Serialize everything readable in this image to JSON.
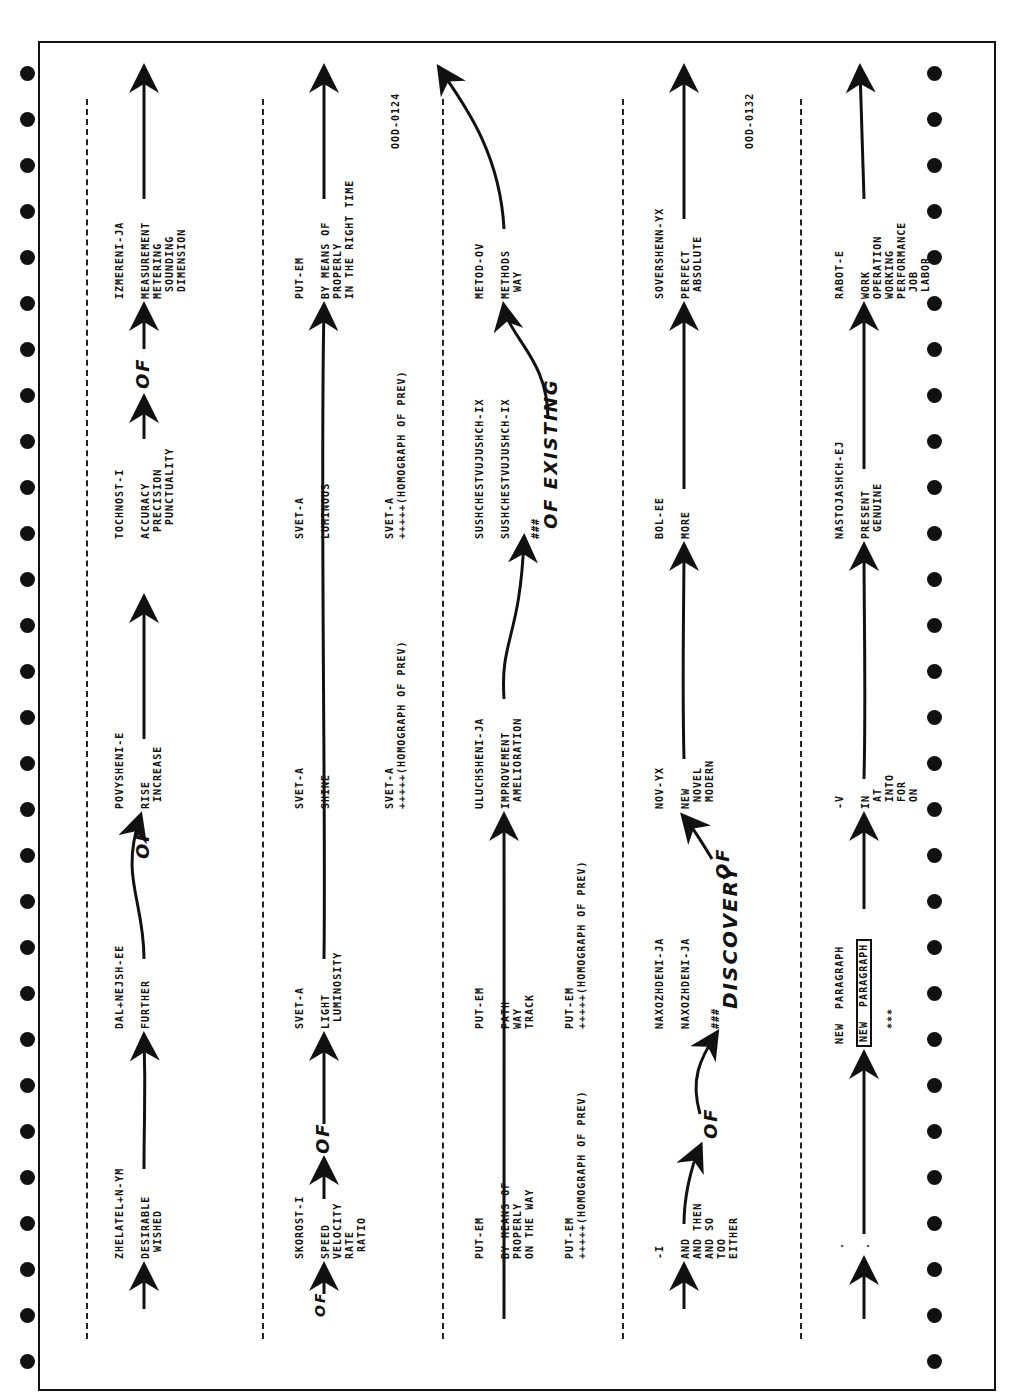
{
  "document": {
    "orientation": "rotated-90-ccw",
    "kind": "machine-translation trace printout",
    "tags": [
      "OOD-0124",
      "OOD-0132"
    ],
    "annotations": [
      "OF",
      "OF",
      "OF",
      "OF",
      "OF",
      "OF EXISTING",
      "DISCOVERY",
      "OF"
    ],
    "rows": [
      {
        "cells": [
          {
            "stem": "ZHELATEL+N-YM",
            "glosses": [
              "DESIRABLE",
              "WISHED"
            ]
          },
          {
            "stem": "DAL+NEJSH-EE",
            "glosses": [
              "FURTHER"
            ]
          },
          {
            "stem": "POVYSHENI-E",
            "glosses": [
              "RISE",
              "INCREASE"
            ]
          },
          {
            "stem": "TOCHNOST-I",
            "glosses": [
              "ACCURACY",
              "PRECISION",
              "PUNCTUALITY"
            ]
          },
          {
            "stem": "IZMERENI-JA",
            "glosses": [
              "MEASUREMENT",
              "METERING",
              "SOUNDING",
              "DIMENSION"
            ]
          }
        ]
      },
      {
        "cells": [
          {
            "stem": "SKOROST-I",
            "glosses": [
              "SPEED",
              "VELOCITY",
              "RATE",
              "RATIO"
            ]
          },
          {
            "stem": "SVET-A",
            "glosses": [
              "LIGHT",
              "LUMINOSITY"
            ]
          },
          {
            "stem": "SVET-A",
            "glosses": [
              "SHINE"
            ],
            "homograph": [
              "SVET-A",
              "+++++(HOMOGRAPH OF PREV)"
            ]
          },
          {
            "stem": "SVET-A",
            "glosses": [
              "LUMINOUS"
            ],
            "homograph": [
              "SVET-A",
              "+++++(HOMOGRAPH OF PREV)"
            ]
          },
          {
            "stem": "PUT-EM",
            "glosses": [
              "BY MEANS OF",
              "PROPERLY",
              "IN THE RIGHT TIME"
            ]
          }
        ],
        "tag": "OOD-0124"
      },
      {
        "cells": [
          {
            "stem": "PUT-EM",
            "glosses": [
              "BY MEANS OF",
              "PROPERLY",
              "ON THE WAY"
            ],
            "homograph": [
              "PUT-EM",
              "+++++(HOMOGRAPH OF PREV)"
            ]
          },
          {
            "stem": "PUT-EM",
            "glosses": [
              "PATH",
              "WAY",
              "TRACK"
            ],
            "homograph": [
              "PUT-EM",
              "+++++(HOMOGRAPH OF PREV)"
            ]
          },
          {
            "stem": "ULUCHSHENI-JA",
            "glosses": [
              "IMPROVEMENT",
              "AMELIORATION"
            ]
          },
          {
            "stem": "SUSHCHESTVUJUSHCH-IX",
            "glosses": [
              "SUSHCHESTVUJUSHCH-IX"
            ],
            "marker": "###"
          },
          {
            "stem": "METOD-OV",
            "glosses": [
              "METHODS",
              "WAY"
            ]
          }
        ]
      },
      {
        "cells": [
          {
            "stem": "-I",
            "glosses": [
              "AND",
              "AND THEN",
              "AND SO",
              "TOO",
              "EITHER"
            ]
          },
          {
            "stem": "NAXOZHDENI-JA",
            "glosses": [
              "NAXOZHDENI-JA"
            ],
            "marker": "###"
          },
          {
            "stem": "NOV-YX",
            "glosses": [
              "NEW",
              "NOVEL",
              "MODERN"
            ]
          },
          {
            "stem": "BOL-EE",
            "glosses": [
              "MORE"
            ]
          },
          {
            "stem": "SOVERSHENN-YX",
            "glosses": [
              "PERFECT",
              "ABSOLUTE"
            ]
          }
        ],
        "tag": "OOD-0132"
      },
      {
        "cells": [
          {
            "stem": ".",
            "glosses": [
              "."
            ]
          },
          {
            "stem": "NEW PARAGRAPH",
            "glosses": [
              "NEW PARAGRAPH"
            ],
            "marker": "***"
          },
          {
            "stem": "-V",
            "glosses": [
              "IN",
              "AT",
              "INTO",
              "FOR",
              "ON"
            ]
          },
          {
            "stem": "NASTOJASHCH-EJ",
            "glosses": [
              "PRESENT",
              "GENUINE"
            ]
          },
          {
            "stem": "RABOT-E",
            "glosses": [
              "WORK",
              "OPERATION",
              "WORKING",
              "PERFORMANCE",
              "JOB",
              "LABOR"
            ]
          }
        ]
      }
    ]
  },
  "text": {
    "r0c0s": "ZHELATEL+N-YM",
    "r0c0g": "DESIRABLE\n WISHED",
    "r0c1s": "DAL+NEJSH-EE",
    "r0c1g": "FURTHER",
    "r0c2s": "POVYSHENI-E",
    "r0c2g": "RISE\n INCREASE",
    "r0c3s": "TOCHNOST-I",
    "r0c3g": "ACCURACY\n PRECISION\n  PUNCTUALITY",
    "r0c4s": "IZMERENI-JA",
    "r0c4g": "MEASUREMENT\nMETERING\n SOUNDING\n DIMENSION",
    "r1c0s": "SKOROST-I",
    "r1c0g": "SPEED\nVELOCITY\nRATE\n RATIO",
    "r1c1s": "SVET-A",
    "r1c1g": "LIGHT\n LUMINOSITY",
    "r1c2s": "SVET-A",
    "r1c2g": "SHINE",
    "r1c2h": "SVET-A\n+++++(HOMOGRAPH OF PREV)",
    "r1c3s": "SVET-A",
    "r1c3g": "LUMINOUS",
    "r1c3h": "SVET-A\n+++++(HOMOGRAPH OF PREV)",
    "r1c4s": "PUT-EM",
    "r1c4g": "BY MEANS OF\nPROPERLY\nIN THE RIGHT TIME",
    "r1tag": "OOD-0124",
    "r2c0s": "PUT-EM",
    "r2c0g": "BY MEANS OF\nPROPERLY\nON THE WAY",
    "r2c0h": "PUT-EM\n+++++(HOMOGRAPH OF PREV)",
    "r2c1s": "PUT-EM",
    "r2c1g": "PATH\nWAY\nTRACK",
    "r2c1h": "PUT-EM\n+++++(HOMOGRAPH OF PREV)",
    "r2c2s": "ULUCHSHENI-JA",
    "r2c2g": "IMPROVEMENT\n AMELIORATION",
    "r2c3s": "SUSHCHESTVUJUSHCH-IX",
    "r2c3g": "SUSHCHESTVUJUSHCH-IX",
    "r2c3m": "###",
    "r2c4s": "METOD-OV",
    "r2c4g": "METHODS\n WAY",
    "r3c0s": "-I",
    "r3c0g": "AND\nAND THEN\nAND SO\nTOO\nEITHER",
    "r3c1s": "NAXOZHDENI-JA",
    "r3c1g": "NAXOZHDENI-JA",
    "r3c1m": "###",
    "r3c2s": "NOV-YX",
    "r3c2g": "NEW\n NOVEL\n MODERN",
    "r3c3s": "BOL-EE",
    "r3c3g": "MORE",
    "r3c4s": "SOVERSHENN-YX",
    "r3c4g": "PERFECT\n ABSOLUTE",
    "r3tag": "OOD-0132",
    "r4c0s": ".",
    "r4c0g": ".",
    "r4c1s": "NEW  PARAGRAPH",
    "r4c1g": "NEW  PARAGRAPH",
    "r4c1m": "***",
    "r4c2s": "-V",
    "r4c2g": "IN\n AT\n INTO\n FOR\n ON",
    "r4c3s": "NASTOJASHCH-EJ",
    "r4c3g": "PRESENT\n GENUINE",
    "r4c4s": "RABOT-E",
    "r4c4g": "WORK\nOPERATION\nWORKING\nPERFORMANCE\n JOB\n LABOR",
    "hand_of": "OF",
    "hand_existing": "OF EXISTING",
    "hand_discovery": "DISCOVERY",
    "hand_hash": "###"
  }
}
